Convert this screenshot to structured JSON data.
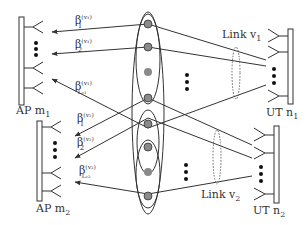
{
  "diagram": {
    "type": "network-schematic",
    "nodes": {
      "ap1": {
        "label": "AP m",
        "sub": "1"
      },
      "ap2": {
        "label": "AP m",
        "sub": "2"
      },
      "ut1": {
        "label": "UT n",
        "sub": "1"
      },
      "ut2": {
        "label": "UT n",
        "sub": "2"
      }
    },
    "links": {
      "link1": {
        "label": "Link v",
        "sub": "1"
      },
      "link2": {
        "label": "Link v",
        "sub": "2"
      }
    },
    "coefficients": [
      {
        "base": "β",
        "sup": "(v₁)",
        "sub": "1"
      },
      {
        "base": "β",
        "sup": "(v₁)",
        "sub": "2"
      },
      {
        "base": "β",
        "sup": "(v₁)",
        "sub": "Lᵥ₁"
      },
      {
        "base": "β",
        "sup": "(v₂)",
        "sub": "1"
      },
      {
        "base": "β",
        "sup": "(v₂)",
        "sub": "2"
      },
      {
        "base": "β",
        "sup": "(v₂)",
        "sub": "Lᵥ₂"
      }
    ],
    "ellipsis_glyph": "⋮",
    "colors": {
      "line": "#333333",
      "node_fill": "#8a8a8a",
      "background": "#ffffff"
    }
  }
}
